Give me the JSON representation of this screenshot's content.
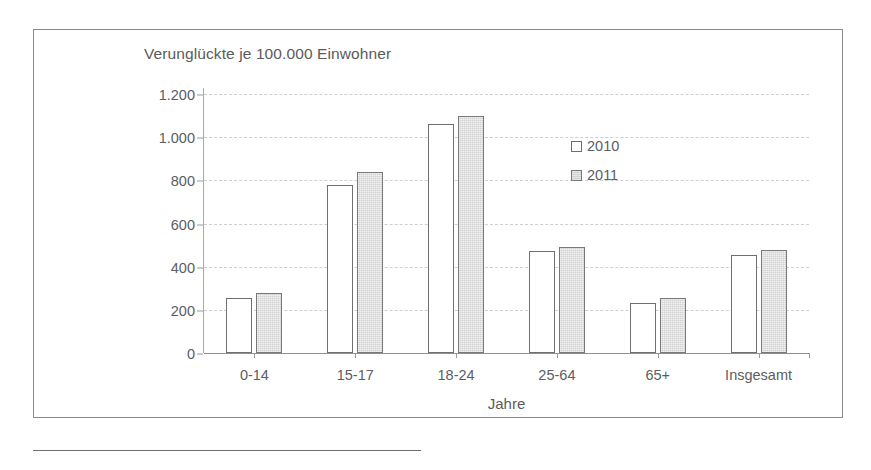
{
  "chart_data": {
    "type": "bar",
    "title": "Verunglückte je 100.000 Einwohner",
    "xlabel": "Jahre",
    "ylabel": "",
    "categories": [
      "0-14",
      "15-17",
      "18-24",
      "25-64",
      "65+",
      "Insgesamt"
    ],
    "series": [
      {
        "name": "2010",
        "values": [
          253,
          778,
          1062,
          472,
          233,
          452
        ]
      },
      {
        "name": "2011",
        "values": [
          278,
          838,
          1097,
          492,
          256,
          475
        ]
      }
    ],
    "ylim": [
      0,
      1200
    ],
    "yticks": [
      0,
      200,
      400,
      600,
      800,
      1000,
      1200
    ],
    "ytick_labels": [
      "0",
      "200",
      "400",
      "600",
      "800",
      "1.000",
      "1.200"
    ],
    "grid": true,
    "legend_position": "top-right",
    "colors": {
      "series_2010_fill": "#ffffff",
      "series_2011_fill": "#d2d2d2",
      "bar_outline": "#6f6f71",
      "gridline": "#cfcfd1",
      "axis": "#8f8f91",
      "text": "#5d5d5f"
    }
  },
  "legend": {
    "items": [
      {
        "label": "2010"
      },
      {
        "label": "2011"
      }
    ]
  }
}
